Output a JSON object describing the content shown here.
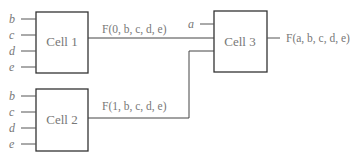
{
  "cells": {
    "cell1": {
      "label": "Cell 1",
      "inputs": [
        "b",
        "c",
        "d",
        "e"
      ],
      "output": "F(0, b, c, d, e)"
    },
    "cell2": {
      "label": "Cell 2",
      "inputs": [
        "b",
        "c",
        "d",
        "e"
      ],
      "output": "F(1, b, c, d, e)"
    },
    "cell3": {
      "label": "Cell 3",
      "inputs": [
        "a"
      ],
      "output": "F(a, b, c, d, e)"
    }
  },
  "colors": {
    "line": "#444444",
    "text": "#777777"
  }
}
